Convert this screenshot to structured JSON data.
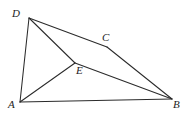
{
  "figure": {
    "background_color": "#ffffff",
    "stroke_color": "#2b2b2b",
    "label_color": "#1d1d1d",
    "width": 186,
    "height": 118,
    "points": {
      "A": {
        "label": "A",
        "x": 20,
        "y": 102,
        "label_x": 8,
        "label_y": 100
      },
      "B": {
        "label": "B",
        "x": 172,
        "y": 99,
        "label_x": 172,
        "label_y": 99
      },
      "C": {
        "label": "C",
        "x": 107,
        "y": 47,
        "label_x": 103,
        "label_y": 32
      },
      "D": {
        "label": "D",
        "x": 29,
        "y": 18,
        "label_x": 13,
        "label_y": 8
      },
      "E": {
        "label": "E",
        "x": 75,
        "y": 63,
        "label_x": 76,
        "label_y": 65
      }
    },
    "segments": [
      {
        "name": "segment-AB",
        "from": "A",
        "to": "B"
      },
      {
        "name": "segment-AD",
        "from": "A",
        "to": "D"
      },
      {
        "name": "segment-AE",
        "from": "A",
        "to": "E"
      },
      {
        "name": "segment-DE",
        "from": "D",
        "to": "E"
      },
      {
        "name": "segment-DC",
        "from": "D",
        "to": "C"
      },
      {
        "name": "segment-CB",
        "from": "C",
        "to": "B"
      },
      {
        "name": "segment-EB",
        "from": "E",
        "to": "B"
      }
    ]
  }
}
